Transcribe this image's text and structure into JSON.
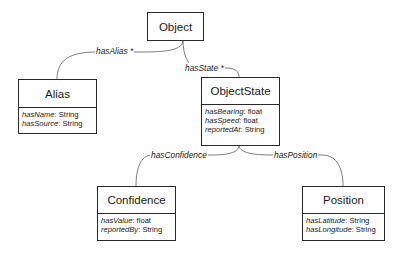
{
  "diagram": {
    "type": "uml-class-diagram",
    "classes": {
      "object": {
        "name": "Object",
        "attributes": []
      },
      "alias": {
        "name": "Alias",
        "attributes": [
          {
            "name": "hasName",
            "type": ": String"
          },
          {
            "name": "hasSource",
            "type": ": String"
          }
        ]
      },
      "objectstate": {
        "name": "ObjectState",
        "attributes": [
          {
            "name": "hasBearing",
            "type": ": float"
          },
          {
            "name": "hasSpeed",
            "type": ": float"
          },
          {
            "name": "reportedAt",
            "type": ": String"
          }
        ]
      },
      "confidence": {
        "name": "Confidence",
        "attributes": [
          {
            "name": "hasValue",
            "type": ": float"
          },
          {
            "name": "reportedBy",
            "type": ": String"
          }
        ]
      },
      "position": {
        "name": "Position",
        "attributes": [
          {
            "name": "hasLatitude",
            "type": ": String"
          },
          {
            "name": "hasLongitude",
            "type": ": String"
          }
        ]
      }
    },
    "relations": {
      "has_alias": {
        "label": "hasAlias *",
        "from": "Object",
        "to": "Alias",
        "multiplicity": "*"
      },
      "has_state": {
        "label": "hasState *",
        "from": "Object",
        "to": "ObjectState",
        "multiplicity": "*"
      },
      "has_confidence": {
        "label": "hasConfidence",
        "from": "ObjectState",
        "to": "Confidence"
      },
      "has_position": {
        "label": "hasPosition",
        "from": "ObjectState",
        "to": "Position"
      }
    }
  }
}
